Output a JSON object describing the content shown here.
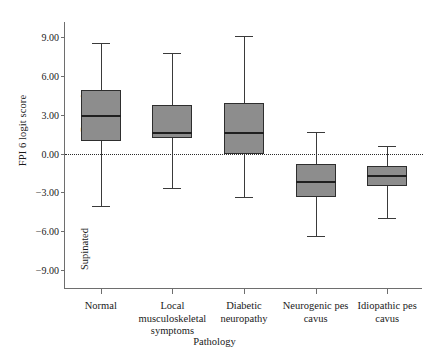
{
  "chart_data": {
    "type": "box",
    "title": "",
    "xlabel": "Pathology",
    "ylabel": "FPI 6 logit score",
    "ylim": [
      -10.5,
      10.2
    ],
    "yticks": [
      9.0,
      6.0,
      3.0,
      0.0,
      -3.0,
      -6.0,
      -9.0
    ],
    "ytick_labels": [
      "9.00",
      "6.00",
      "3.00",
      "0.00",
      "−3.00",
      "−6.00",
      "−9.00"
    ],
    "grid": false,
    "legend": "none",
    "reference_line": {
      "value": 0.0,
      "style": "dotted"
    },
    "annotations": [
      {
        "text": "Pornated",
        "position": "upper-left-inside",
        "orientation": "vertical"
      },
      {
        "text": "Supinated",
        "position": "lower-left-inside",
        "orientation": "vertical"
      }
    ],
    "categories": [
      "Normal",
      "Local musculoskeletal symptoms",
      "Diabetic neuropathy",
      "Neurogenic pes cavus",
      "Idiopathic pes cavus"
    ],
    "category_lines": [
      [
        "Normal"
      ],
      [
        "Local",
        "musculoskeletal",
        "symptoms"
      ],
      [
        "Diabetic",
        "neuropathy"
      ],
      [
        "Neurogenic pes",
        "cavus"
      ],
      [
        "Idiopathic pes",
        "cavus"
      ]
    ],
    "boxes": [
      {
        "category": "Normal",
        "whisker_low": -4.1,
        "q1": 1.0,
        "median": 3.0,
        "q3": 4.9,
        "whisker_high": 8.6
      },
      {
        "category": "Local musculoskeletal symptoms",
        "whisker_low": -2.7,
        "q1": 1.2,
        "median": 1.7,
        "q3": 3.8,
        "whisker_high": 7.8
      },
      {
        "category": "Diabetic neuropathy",
        "whisker_low": -3.4,
        "q1": 0.0,
        "median": 1.7,
        "q3": 3.9,
        "whisker_high": 9.1
      },
      {
        "category": "Neurogenic pes cavus",
        "whisker_low": -6.4,
        "q1": -3.4,
        "median": -2.1,
        "q3": -0.8,
        "whisker_high": 1.7
      },
      {
        "category": "Idiopathic pes cavus",
        "whisker_low": -5.0,
        "q1": -2.5,
        "median": -1.7,
        "q3": -1.0,
        "whisker_high": 0.6
      }
    ]
  }
}
